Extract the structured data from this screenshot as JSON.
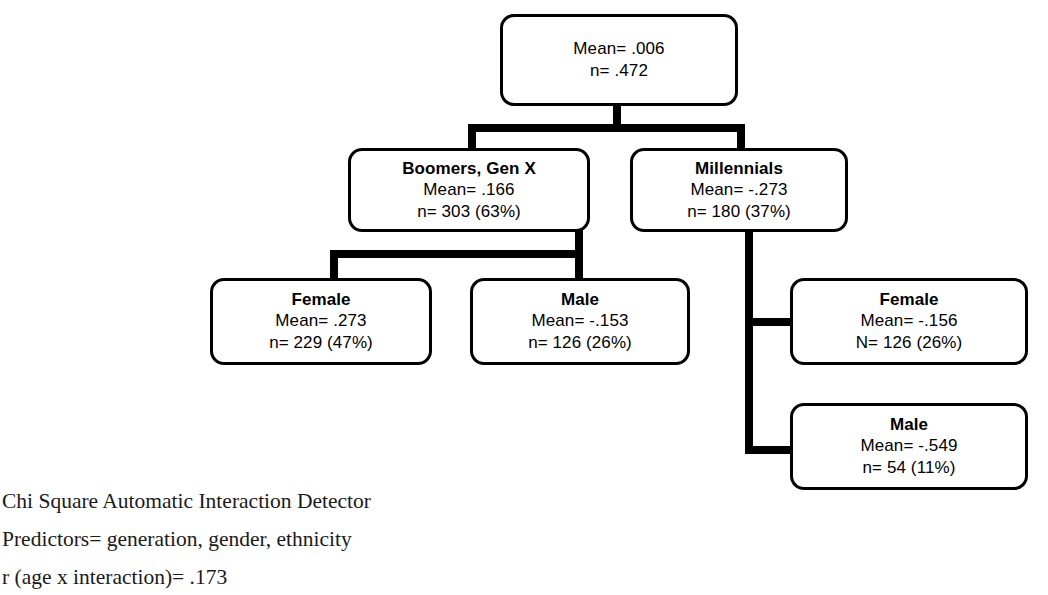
{
  "diagram": {
    "type": "CHAID decision tree",
    "nodes": {
      "root": {
        "title": "",
        "mean": "Mean= .006",
        "n": "n= .472"
      },
      "boomers": {
        "title": "Boomers, Gen X",
        "mean": "Mean= .166",
        "n": "n= 303 (63%)"
      },
      "millennials": {
        "title": "Millennials",
        "mean": "Mean= -.273",
        "n": "n= 180 (37%)"
      },
      "boomers_female": {
        "title": "Female",
        "mean": "Mean= .273",
        "n": "n= 229 (47%)"
      },
      "boomers_male": {
        "title": "Male",
        "mean": "Mean= -.153",
        "n": "n= 126 (26%)"
      },
      "millennials_female": {
        "title": "Female",
        "mean": "Mean= -.156",
        "n": "N= 126 (26%)"
      },
      "millennials_male": {
        "title": "Male",
        "mean": "Mean= -.549",
        "n": "n= 54 (11%)"
      }
    }
  },
  "caption": {
    "line1": "Chi Square Automatic Interaction Detector",
    "line2": "Predictors= generation, gender, ethnicity",
    "line3": "r (age x interaction)= .173"
  },
  "colors": {
    "stroke": "#000000",
    "background": "#ffffff",
    "text": "#000000",
    "caption_text": "#1a1a1a"
  }
}
